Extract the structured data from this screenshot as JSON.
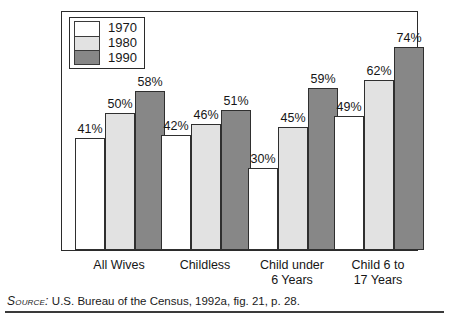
{
  "chart_data": {
    "type": "bar",
    "title": "",
    "subtitle": "",
    "xlabel": "",
    "ylabel": "",
    "ylim": [
      0,
      85
    ],
    "grid": false,
    "legend_position": "top-left",
    "value_suffix": "%",
    "categories": [
      "All Wives",
      "Childless",
      "Child under 6 Years",
      "Child 6 to 17 Years"
    ],
    "category_lines": [
      [
        "All Wives"
      ],
      [
        "Childless"
      ],
      [
        "Child under",
        "6 Years"
      ],
      [
        "Child 6 to",
        "17 Years"
      ]
    ],
    "series": [
      {
        "name": "1970",
        "color": "#ffffff",
        "values": [
          41,
          42,
          30,
          49
        ],
        "labels": [
          "41%",
          "42%",
          "30%",
          "49%"
        ]
      },
      {
        "name": "1980",
        "color": "#e2e2e2",
        "values": [
          50,
          46,
          45,
          62
        ],
        "labels": [
          "50%",
          "46%",
          "45%",
          "62%"
        ]
      },
      {
        "name": "1990",
        "color": "#878787",
        "values": [
          58,
          51,
          59,
          74
        ],
        "labels": [
          "58%",
          "51%",
          "59%",
          "74%"
        ]
      }
    ],
    "annotations": []
  },
  "legend": {
    "items": [
      {
        "label": "1970",
        "color": "#ffffff"
      },
      {
        "label": "1980",
        "color": "#e2e2e2"
      },
      {
        "label": "1990",
        "color": "#878787"
      }
    ]
  },
  "source": {
    "label": "Source:",
    "text": "U.S. Bureau of the Census, 1992a, fig. 21, p. 28."
  },
  "colors": {
    "frame": "#2b2b2b",
    "bar_outline": "#2f2f2f",
    "text": "#161616",
    "series_1970": "#ffffff",
    "series_1980": "#e2e2e2",
    "series_1990": "#878787"
  }
}
